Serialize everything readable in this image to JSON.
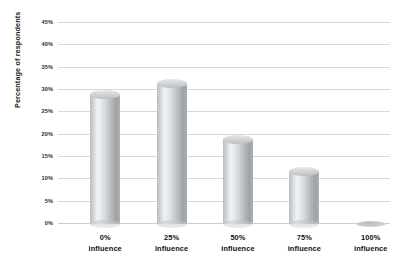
{
  "chart_data": {
    "type": "bar",
    "title": "",
    "subtitle": "",
    "xlabel": "",
    "ylabel": "Percentage of respondents",
    "categories": [
      "0%\ninfluence",
      "25%\ninfluence",
      "50%\ninfluence",
      "75%\ninfluence",
      "100%\ninfluence"
    ],
    "category_lines": [
      [
        "0%",
        "influence"
      ],
      [
        "25%",
        "influence"
      ],
      [
        "50%",
        "influence"
      ],
      [
        "75%",
        "influence"
      ],
      [
        "100%",
        "influence"
      ]
    ],
    "values": [
      29.0,
      31.5,
      19.0,
      11.8,
      0.3
    ],
    "ylim": [
      0,
      45
    ],
    "ytick_values": [
      0,
      5,
      10,
      15,
      20,
      25,
      30,
      35,
      40,
      45
    ],
    "ytick_labels": [
      "0%",
      "5%",
      "10%",
      "15%",
      "20%",
      "25%",
      "30%",
      "35%",
      "40%",
      "45%"
    ],
    "grid": true,
    "legend": false,
    "legend_position": "none",
    "bar_style": "cylinder",
    "bar_color": "#c8cbce",
    "grid_color": "#d5d9dd",
    "text_color": "#111111"
  }
}
